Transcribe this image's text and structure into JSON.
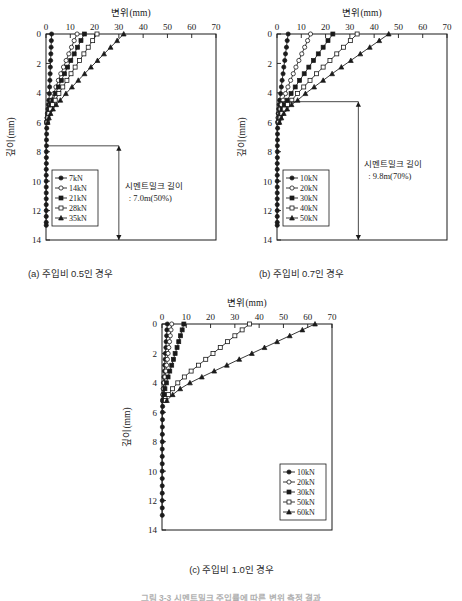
{
  "figure": {
    "caption": "그림 3-3 시멘트밀크 주입률에 따른 변위 측정 결과"
  },
  "panels": [
    {
      "id": "a",
      "caption": "(a) 주입비 0.5인 경우",
      "annotation": {
        "line1": "시멘트밀크 길이",
        "line2": ": 7.0m(50%)",
        "arrow_from_depth": 7.6,
        "arrow_to_depth": 14.0
      },
      "chart_data": {
        "type": "line",
        "title": "",
        "xlabel": "변위(mm)",
        "ylabel": "깊이(mm)",
        "xlim": [
          0,
          70
        ],
        "ylim": [
          0,
          14
        ],
        "xticks": [
          0,
          10,
          20,
          30,
          40,
          50,
          60,
          70
        ],
        "yticks": [
          0,
          2,
          4,
          6,
          8,
          10,
          12,
          14
        ],
        "y_inverted": true,
        "grid": false,
        "legend_position": "lower-left",
        "series": [
          {
            "name": "7kN",
            "marker": "filled-circle",
            "depth": [
              0,
              0.45,
              0.9,
              1.35,
              1.8,
              2.25,
              2.7,
              3.15,
              3.6,
              4.05,
              4.5,
              4.8,
              5.1,
              5.4,
              5.7,
              6.0,
              6.4,
              6.8,
              7.2,
              7.6,
              8.0,
              8.4,
              8.8,
              9.2,
              9.6,
              10.0,
              10.4,
              10.8,
              11.2,
              11.6,
              12.0,
              12.4,
              12.8,
              13.0
            ],
            "displacement": [
              2.3,
              2.2,
              2.1,
              2.0,
              1.9,
              1.8,
              1.7,
              1.6,
              1.5,
              1.4,
              1.2,
              1.0,
              0.8,
              0.6,
              0.45,
              0.35,
              0.3,
              0.25,
              0.2,
              0.2,
              0.15,
              0.15,
              0.15,
              0.1,
              0.1,
              0.1,
              0.1,
              0.1,
              0.1,
              0.1,
              0.1,
              0.1,
              0.1,
              0.1
            ]
          },
          {
            "name": "14kN",
            "marker": "open-circle",
            "depth": [
              0,
              0.45,
              0.9,
              1.35,
              1.8,
              2.25,
              2.7,
              3.15,
              3.6,
              4.05,
              4.5,
              4.8,
              5.1,
              5.4,
              5.7,
              6.0
            ],
            "displacement": [
              12.8,
              11.6,
              10.5,
              9.4,
              8.3,
              7.2,
              6.1,
              5.1,
              4.1,
              3.2,
              2.3,
              1.7,
              1.2,
              0.8,
              0.5,
              0.3
            ]
          },
          {
            "name": "21kN",
            "marker": "filled-square",
            "depth": [
              0,
              0.45,
              0.9,
              1.35,
              1.8,
              2.25,
              2.7,
              3.15,
              3.6,
              4.05,
              4.5,
              4.8,
              5.1,
              5.4,
              5.7,
              6.0
            ],
            "displacement": [
              15.8,
              14.4,
              13.0,
              11.6,
              10.2,
              8.9,
              7.6,
              6.3,
              5.1,
              3.9,
              2.8,
              2.0,
              1.4,
              0.9,
              0.6,
              0.35
            ]
          },
          {
            "name": "28kN",
            "marker": "open-square",
            "depth": [
              0,
              0.45,
              0.9,
              1.35,
              1.8,
              2.25,
              2.7,
              3.15,
              3.6,
              4.05,
              4.5,
              4.8,
              5.1,
              5.4,
              5.7,
              6.0
            ],
            "displacement": [
              21.0,
              19.2,
              17.4,
              15.6,
              13.8,
              12.0,
              10.3,
              8.6,
              6.9,
              5.3,
              3.8,
              2.7,
              1.9,
              1.2,
              0.8,
              0.45
            ]
          },
          {
            "name": "35kN",
            "marker": "filled-triangle",
            "depth": [
              0,
              0.45,
              0.9,
              1.35,
              1.8,
              2.25,
              2.7,
              3.15,
              3.6,
              4.05,
              4.5,
              4.8,
              5.1,
              5.4,
              5.7,
              6.0
            ],
            "displacement": [
              32.0,
              29.3,
              26.6,
              23.9,
              21.2,
              18.5,
              15.9,
              13.3,
              10.7,
              8.2,
              5.9,
              4.2,
              2.9,
              1.9,
              1.2,
              0.7
            ]
          }
        ]
      }
    },
    {
      "id": "b",
      "caption": "(b) 주입비 0.7인 경우",
      "annotation": {
        "line1": "시멘트밀크 길이",
        "line2": ": 9.8m(70%)",
        "arrow_from_depth": 4.6,
        "arrow_to_depth": 14.0
      },
      "chart_data": {
        "type": "line",
        "title": "",
        "xlabel": "변위(mm)",
        "ylabel": "깊이(mm)",
        "xlim": [
          0,
          70
        ],
        "ylim": [
          0,
          14
        ],
        "xticks": [
          0,
          10,
          20,
          30,
          40,
          50,
          60,
          70
        ],
        "yticks": [
          0,
          2,
          4,
          6,
          8,
          10,
          12,
          14
        ],
        "y_inverted": true,
        "grid": false,
        "legend_position": "lower-left",
        "series": [
          {
            "name": "10kN",
            "marker": "filled-circle",
            "depth": [
              0,
              0.45,
              0.9,
              1.35,
              1.8,
              2.25,
              2.7,
              3.15,
              3.6,
              4.05,
              4.5,
              4.8,
              5.1,
              5.4,
              5.7,
              6.0,
              6.4,
              6.8,
              7.2,
              7.6,
              8.0,
              8.4,
              8.8,
              9.2,
              9.6,
              10.0,
              10.4,
              10.8,
              11.2,
              11.6,
              12.0,
              12.4,
              12.8,
              13.0
            ],
            "displacement": [
              4.6,
              4.2,
              3.9,
              3.5,
              3.2,
              2.8,
              2.5,
              2.1,
              1.8,
              1.5,
              1.1,
              0.9,
              0.7,
              0.5,
              0.4,
              0.3,
              0.25,
              0.2,
              0.2,
              0.15,
              0.15,
              0.15,
              0.1,
              0.1,
              0.1,
              0.1,
              0.1,
              0.1,
              0.1,
              0.1,
              0.1,
              0.1,
              0.1,
              0.1
            ]
          },
          {
            "name": "20kN",
            "marker": "open-circle",
            "depth": [
              0,
              0.45,
              0.9,
              1.35,
              1.8,
              2.25,
              2.7,
              3.15,
              3.6,
              4.05,
              4.5,
              4.8,
              5.1,
              5.4,
              5.7,
              6.0
            ],
            "displacement": [
              13.8,
              12.6,
              11.4,
              10.2,
              9.0,
              7.8,
              6.7,
              5.6,
              4.5,
              3.5,
              2.5,
              1.8,
              1.3,
              0.9,
              0.6,
              0.35
            ]
          },
          {
            "name": "30kN",
            "marker": "filled-square",
            "depth": [
              0,
              0.45,
              0.9,
              1.35,
              1.8,
              2.25,
              2.7,
              3.15,
              3.6,
              4.05,
              4.5,
              4.8,
              5.1,
              5.4,
              5.7,
              6.0
            ],
            "displacement": [
              23.0,
              21.0,
              19.0,
              17.0,
              15.0,
              13.1,
              11.2,
              9.3,
              7.5,
              5.8,
              4.2,
              3.0,
              2.1,
              1.4,
              0.9,
              0.5
            ]
          },
          {
            "name": "40kN",
            "marker": "open-square",
            "depth": [
              0,
              0.45,
              0.9,
              1.35,
              1.8,
              2.25,
              2.7,
              3.15,
              3.6,
              4.05,
              4.5,
              4.8,
              5.1,
              5.4,
              5.7,
              6.0
            ],
            "displacement": [
              33.0,
              30.2,
              27.4,
              24.6,
              21.8,
              19.0,
              16.3,
              13.6,
              11.0,
              8.4,
              6.1,
              4.3,
              3.0,
              2.0,
              1.3,
              0.7
            ]
          },
          {
            "name": "50kN",
            "marker": "filled-triangle",
            "depth": [
              0,
              0.45,
              0.9,
              1.35,
              1.8,
              2.25,
              2.7,
              3.15,
              3.6,
              4.05,
              4.5,
              4.8,
              5.1,
              5.4,
              5.7,
              6.0
            ],
            "displacement": [
              46.0,
              42.1,
              38.2,
              34.3,
              30.4,
              26.5,
              22.7,
              19.0,
              15.3,
              11.7,
              8.5,
              6.0,
              4.2,
              2.8,
              1.8,
              1.0
            ]
          }
        ]
      }
    },
    {
      "id": "c",
      "caption": "(c) 주입비 1.0인 경우",
      "annotation": null,
      "chart_data": {
        "type": "line",
        "title": "",
        "xlabel": "변위(mm)",
        "ylabel": "깊이(mm)",
        "xlim": [
          0,
          70
        ],
        "ylim": [
          0,
          14
        ],
        "xticks": [
          0,
          10,
          20,
          30,
          40,
          50,
          60,
          70
        ],
        "yticks": [
          0,
          2,
          4,
          6,
          8,
          10,
          12,
          14
        ],
        "y_inverted": true,
        "grid": false,
        "legend_position": "lower-right",
        "series": [
          {
            "name": "10kN",
            "marker": "filled-circle",
            "depth": [
              0,
              0.4,
              0.8,
              1.2,
              1.6,
              2.0,
              2.4,
              2.8,
              3.2,
              3.6,
              4.0,
              4.4,
              4.8,
              5.2,
              5.6,
              6.0,
              6.5,
              7.0,
              7.5,
              8.0,
              8.5,
              9.0,
              9.5,
              10.0,
              10.5,
              11.0,
              11.5,
              12.0,
              12.5,
              13.0
            ],
            "displacement": [
              2.2,
              2.0,
              1.9,
              1.7,
              1.6,
              1.4,
              1.3,
              1.1,
              1.0,
              0.8,
              0.6,
              0.5,
              0.4,
              0.3,
              0.25,
              0.2,
              0.2,
              0.15,
              0.15,
              0.15,
              0.1,
              0.1,
              0.1,
              0.1,
              0.1,
              0.1,
              0.1,
              0.1,
              0.1,
              0.1
            ]
          },
          {
            "name": "20kN",
            "marker": "open-circle",
            "depth": [
              0,
              0.4,
              0.8,
              1.2,
              1.6,
              2.0,
              2.4,
              2.8,
              3.2,
              3.6,
              4.0,
              4.4,
              4.8,
              5.2
            ],
            "displacement": [
              4.0,
              3.7,
              3.4,
              3.1,
              2.8,
              2.5,
              2.2,
              1.9,
              1.6,
              1.2,
              0.9,
              0.6,
              0.4,
              0.25
            ]
          },
          {
            "name": "30kN",
            "marker": "filled-square",
            "depth": [
              0,
              0.4,
              0.8,
              1.2,
              1.6,
              2.0,
              2.4,
              2.8,
              3.2,
              3.6,
              4.0,
              4.4,
              4.8,
              5.2
            ],
            "displacement": [
              9.0,
              8.3,
              7.6,
              6.9,
              6.2,
              5.4,
              4.7,
              4.0,
              3.2,
              2.5,
              1.8,
              1.2,
              0.8,
              0.45
            ]
          },
          {
            "name": "50kN",
            "marker": "open-square",
            "depth": [
              0,
              0.4,
              0.8,
              1.2,
              1.6,
              2.0,
              2.4,
              2.8,
              3.2,
              3.6,
              4.0,
              4.4,
              4.8,
              5.2
            ],
            "displacement": [
              36.0,
              33.0,
              30.0,
              27.0,
              24.0,
              21.0,
              18.0,
              15.0,
              12.0,
              9.2,
              6.5,
              4.3,
              2.7,
              1.4
            ]
          },
          {
            "name": "60kN",
            "marker": "filled-triangle",
            "depth": [
              0,
              0.4,
              0.8,
              1.2,
              1.6,
              2.0,
              2.4,
              2.8,
              3.2,
              3.6,
              4.0,
              4.4,
              4.8,
              5.2
            ],
            "displacement": [
              63.0,
              57.8,
              52.6,
              47.4,
              42.2,
              37.0,
              31.8,
              26.7,
              21.5,
              16.4,
              11.5,
              7.5,
              4.4,
              2.0
            ]
          }
        ]
      }
    }
  ]
}
